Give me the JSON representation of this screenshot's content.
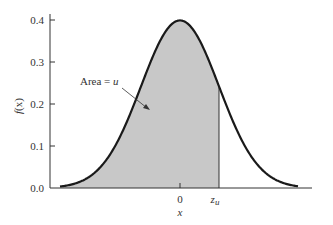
{
  "chart_data": {
    "type": "area",
    "title": "",
    "xlabel": "x",
    "ylabel": "f(x)",
    "ylim": [
      0.0,
      0.4
    ],
    "yticks": [
      "0.0",
      "0.1",
      "0.2",
      "0.3",
      "0.4"
    ],
    "xticks": [
      "0",
      "z_u"
    ],
    "grid": false,
    "distribution": "standard normal density",
    "series": [
      {
        "name": "f(x)",
        "x": [
          -3,
          -2,
          -1,
          0,
          1,
          2,
          3
        ],
        "values": [
          0.004,
          0.054,
          0.242,
          0.399,
          0.242,
          0.054,
          0.004
        ]
      }
    ],
    "shaded_region": {
      "from": "-inf",
      "to": "z_u",
      "z_u_approx": 1.0,
      "fill": "#c8c8c8"
    },
    "annotations": [
      {
        "text": "Area = u",
        "arrow_to": "shaded region"
      }
    ]
  },
  "labels": {
    "ylabel_f": "f",
    "ylabel_x": "(x)",
    "xlabel": "x",
    "tick_zero": "0",
    "tick_zu_main": "z",
    "tick_zu_sub": "u",
    "annotation_prefix": "Area = ",
    "annotation_var": "u",
    "y0": "0.0",
    "y1": "0.1",
    "y2": "0.2",
    "y3": "0.3",
    "y4": "0.4"
  }
}
